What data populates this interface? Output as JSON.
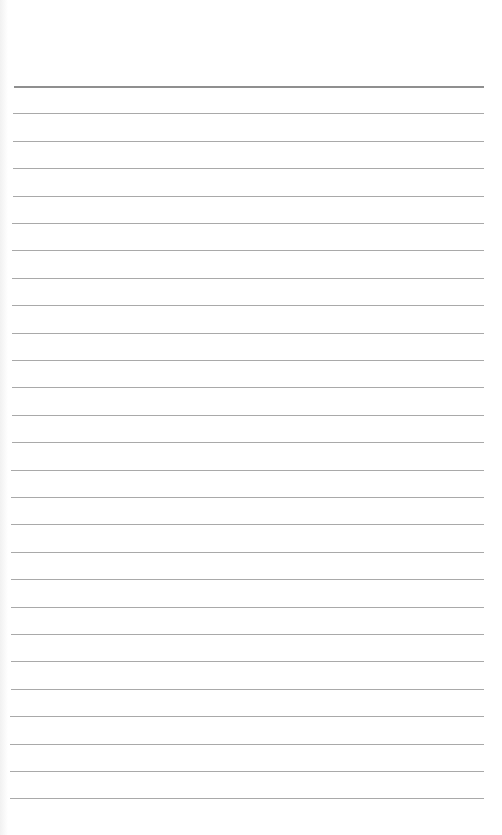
{
  "page": {
    "type": "lined-paper",
    "background_color": "#ffffff",
    "line_color": "#a9a9a9",
    "top_line_color": "#8f8f8f",
    "line_count": 27,
    "first_line_y": 86,
    "line_spacing": 27.4,
    "line_left_x": 13,
    "line_right_x": 484
  }
}
